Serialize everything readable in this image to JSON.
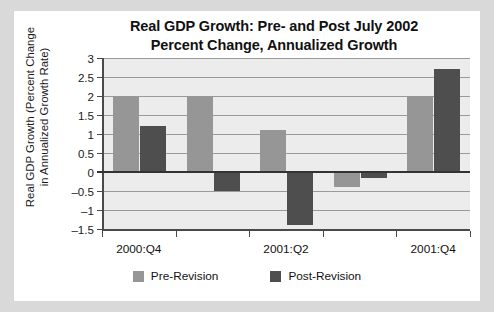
{
  "chart_data": {
    "type": "bar",
    "title": "Real GDP Growth: Pre- and Post July 2002\nPercent Change, Annualized Growth",
    "title_line1": "Real GDP Growth: Pre- and Post July 2002",
    "title_line2": "Percent Change, Annualized Growth",
    "ylabel": "Real GDP Growth (Percent Change in Annualized Growth Rate)",
    "ylabel_line1": "Real GDP Growth (Percent Change",
    "ylabel_line2": "in Annualized Growth Rate)",
    "xlabel": "",
    "categories": [
      "2000:Q4",
      "2001:Q1",
      "2001:Q2",
      "2001:Q3",
      "2001:Q4"
    ],
    "visible_tick_labels": [
      "2000:Q4",
      "2001:Q2",
      "2001:Q4"
    ],
    "series": [
      {
        "name": "Pre-Revision",
        "color": "#969696",
        "values": [
          2.0,
          2.0,
          1.1,
          -0.4,
          2.0
        ]
      },
      {
        "name": "Post-Revision",
        "color": "#4e4e4e",
        "values": [
          1.2,
          -0.5,
          -1.4,
          -0.15,
          2.7
        ]
      }
    ],
    "ylim": [
      -1.5,
      3
    ],
    "ytick_labels": [
      "3",
      "2.5",
      "2",
      "1.5",
      "1",
      "0.5",
      "0",
      "–0.5",
      "–1",
      "–1.5"
    ],
    "ytick_values": [
      3,
      2.5,
      2,
      1.5,
      1,
      0.5,
      0,
      -0.5,
      -1,
      -1.5
    ],
    "grid": true,
    "legend_position": "bottom",
    "plot_background": "#ececec",
    "page_background": "#d9d9d9",
    "card_background": "#ffffff"
  }
}
